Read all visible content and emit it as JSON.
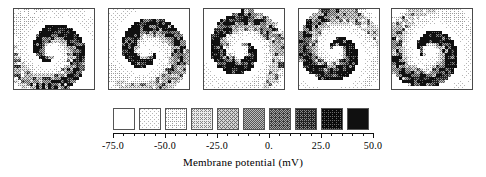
{
  "figure": {
    "type": "spatiotemporal-grayscale-map-sequence"
  },
  "panels": [
    {
      "name": "panel-frame-1",
      "index": 1,
      "left": 13,
      "grid": 26,
      "phase": 0.0
    },
    {
      "name": "panel-frame-2",
      "index": 2,
      "left": 108,
      "grid": 26,
      "phase": 0.2
    },
    {
      "name": "panel-frame-3",
      "index": 3,
      "left": 203,
      "grid": 26,
      "phase": 0.4
    },
    {
      "name": "panel-frame-4",
      "index": 4,
      "left": 298,
      "grid": 26,
      "phase": 0.6
    },
    {
      "name": "panel-frame-5",
      "index": 5,
      "left": 391,
      "grid": 26,
      "phase": 0.8
    }
  ],
  "colorbar": {
    "title": "Membrane potential  (mV)",
    "n_swatches": 10,
    "swatch_levels": [
      0.0,
      0.111,
      0.222,
      0.333,
      0.444,
      0.556,
      0.667,
      0.778,
      0.889,
      1.0
    ],
    "swatch_hex": [
      "#ffffff",
      "#e3e3e3",
      "#c9c9c9",
      "#b3b3b3",
      "#9c9c9c",
      "#848484",
      "#6b6b6b",
      "#4f4f4f",
      "#303030",
      "#101010"
    ],
    "range_min": -75.0,
    "range_max": 50.0,
    "tick_labels": [
      "-75.0",
      "-50.0",
      "-25.0",
      "0.",
      "25.0",
      "50.0"
    ],
    "tick_values": [
      -75.0,
      -50.0,
      -25.0,
      0.0,
      25.0,
      50.0
    ],
    "minor_ticks_per_interval": 4
  },
  "chart_data": {
    "type": "heatmap",
    "title": "",
    "xlabel": "Membrane potential  (mV)",
    "ylabel": "",
    "colormap": "grayscale-inverted",
    "colorbar_range": [
      -75.0,
      50.0
    ],
    "colorbar_tick_labels": [
      "-75.0",
      "-50.0",
      "-25.0",
      "0.",
      "25.0",
      "50.0"
    ],
    "colorbar_tick_values": [
      -75.0,
      -50.0,
      -25.0,
      0.0,
      25.0,
      50.0
    ],
    "n_levels": 10,
    "level_hex": [
      "#ffffff",
      "#e3e3e3",
      "#c9c9c9",
      "#b3b3b3",
      "#9c9c9c",
      "#848484",
      "#6b6b6b",
      "#4f4f4f",
      "#303030",
      "#101010"
    ],
    "grid_size": [
      26,
      26
    ],
    "n_frames": 5,
    "frame_phases": [
      0.0,
      0.2,
      0.4,
      0.6,
      0.8
    ],
    "value_min": -75.0,
    "value_max": 50.0,
    "spiral": {
      "center": [
        0.46,
        0.52
      ],
      "arm_turns": 1.15,
      "arm_width": 0.16,
      "core_radius": 0.1,
      "rotation_per_frame_deg": 62
    }
  }
}
